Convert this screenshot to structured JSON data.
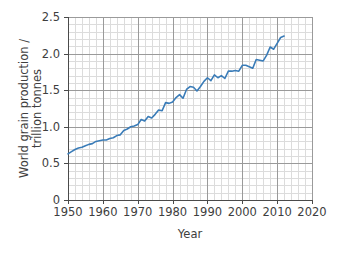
{
  "chart_data": {
    "type": "line",
    "title": "",
    "xlabel": "Year",
    "ylabel": "World grain production / trillion tonnes",
    "ylabel_line1": "World grain production /",
    "ylabel_line2": "trillion tonnes",
    "xlim": [
      1950,
      2020
    ],
    "ylim": [
      0,
      2.5
    ],
    "xticks": [
      1950,
      1960,
      1970,
      1980,
      1990,
      2000,
      2010,
      2020
    ],
    "xtick_labels": [
      "1950",
      "1960",
      "1970",
      "1980",
      "1990",
      "2000",
      "2010",
      "2020"
    ],
    "yticks": [
      0,
      0.5,
      1.0,
      1.5,
      2.0,
      2.5
    ],
    "ytick_labels": [
      "0",
      "0.5",
      "1.0",
      "1.5",
      "2.0",
      "2.5"
    ],
    "x_minor_step": 2,
    "y_minor_step": 0.1,
    "grid": true,
    "grid_major_color": "#9a9a9a",
    "grid_minor_color": "#dcdcdc",
    "axis_color": "#4a4a4a",
    "line_color": "#3a7cb8",
    "line_width": 1.6,
    "legend": null,
    "legend_position": "none",
    "series": [
      {
        "name": "World grain production",
        "x": [
          1950,
          1951,
          1952,
          1953,
          1954,
          1955,
          1956,
          1957,
          1958,
          1959,
          1960,
          1961,
          1962,
          1963,
          1964,
          1965,
          1966,
          1967,
          1968,
          1969,
          1970,
          1971,
          1972,
          1973,
          1974,
          1975,
          1976,
          1977,
          1978,
          1979,
          1980,
          1981,
          1982,
          1983,
          1984,
          1985,
          1986,
          1987,
          1988,
          1989,
          1990,
          1991,
          1992,
          1993,
          1994,
          1995,
          1996,
          1997,
          1998,
          1999,
          2000,
          2001,
          2002,
          2003,
          2004,
          2005,
          2006,
          2007,
          2008,
          2009,
          2010,
          2011,
          2012
        ],
        "values": [
          0.63,
          0.66,
          0.69,
          0.71,
          0.72,
          0.74,
          0.76,
          0.77,
          0.8,
          0.81,
          0.82,
          0.82,
          0.84,
          0.85,
          0.88,
          0.89,
          0.95,
          0.97,
          1.0,
          1.01,
          1.03,
          1.1,
          1.08,
          1.14,
          1.12,
          1.17,
          1.23,
          1.22,
          1.33,
          1.32,
          1.34,
          1.4,
          1.44,
          1.39,
          1.51,
          1.55,
          1.54,
          1.49,
          1.55,
          1.62,
          1.67,
          1.63,
          1.71,
          1.67,
          1.7,
          1.66,
          1.76,
          1.76,
          1.77,
          1.76,
          1.84,
          1.84,
          1.82,
          1.8,
          1.92,
          1.91,
          1.9,
          1.98,
          2.09,
          2.06,
          2.14,
          2.22,
          2.24
        ],
        "color": "#3a7cb8"
      }
    ],
    "units": "trillion tonnes",
    "value_range_note": {
      "start_year": 1950,
      "start_value": 0.63,
      "end_year": 2012,
      "end_value": 2.24,
      "peak_value": 2.24
    }
  },
  "plot_geometry": {
    "left": 68,
    "right": 312,
    "top": 17,
    "bottom": 200
  }
}
